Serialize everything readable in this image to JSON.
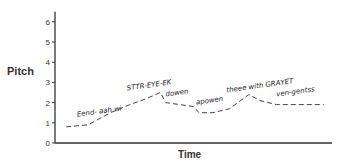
{
  "chart_data": {
    "type": "line",
    "title": "",
    "xlabel": "Time",
    "ylabel": "Pitch",
    "ylim": [
      0,
      6.5
    ],
    "yticks": [
      0,
      1,
      2,
      3,
      4,
      5,
      6
    ],
    "xticks": [],
    "grid": false,
    "legend": null,
    "series": [
      {
        "name": "pitch contour",
        "style": "dashed",
        "x": [
          0.04,
          0.12,
          0.2,
          0.27,
          0.33,
          0.38,
          0.4,
          0.45,
          0.5,
          0.52,
          0.57,
          0.63,
          0.67,
          0.7,
          0.74,
          0.8,
          0.87,
          0.97
        ],
        "values": [
          0.8,
          0.9,
          1.5,
          1.9,
          2.2,
          2.5,
          2.0,
          1.9,
          1.8,
          1.5,
          1.5,
          1.7,
          2.1,
          2.4,
          2.1,
          1.9,
          1.9,
          1.9
        ]
      }
    ],
    "annotations": [
      {
        "text": "Eend- aah wi",
        "x": 0.08,
        "y": 1.3
      },
      {
        "text": "STTR-EYE-EK",
        "x": 0.26,
        "y": 2.6
      },
      {
        "text": "dowen",
        "x": 0.4,
        "y": 2.3
      },
      {
        "text": "apowen",
        "x": 0.51,
        "y": 1.9
      },
      {
        "text": "theee with GRAYET",
        "x": 0.62,
        "y": 2.5
      },
      {
        "text": "ven-gentss",
        "x": 0.8,
        "y": 2.3
      }
    ]
  },
  "labels": {
    "ylabel": "Pitch",
    "xlabel": "Time"
  }
}
